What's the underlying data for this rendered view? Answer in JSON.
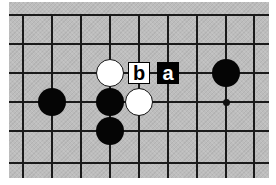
{
  "diagram": {
    "type": "go-board-fragment",
    "colors": {
      "board": "#bdbdbd",
      "grid": "#1a1a1a",
      "black_stone": "#050505",
      "white_stone": "#ffffff"
    },
    "grid": {
      "x_lines": [
        23,
        52,
        81,
        110,
        139,
        168,
        197,
        226,
        254
      ],
      "y_lines": [
        15,
        44,
        73,
        102,
        131,
        163
      ]
    },
    "stones": [
      {
        "color": "white",
        "col": 3,
        "row": 2
      },
      {
        "color": "black",
        "col": 7,
        "row": 2
      },
      {
        "color": "black",
        "col": 1,
        "row": 3
      },
      {
        "color": "black",
        "col": 3,
        "row": 3
      },
      {
        "color": "white",
        "col": 4,
        "row": 3
      },
      {
        "color": "black",
        "col": 3,
        "row": 4
      }
    ],
    "star_points": [
      {
        "col": 7,
        "row": 3
      }
    ],
    "labels": [
      {
        "text": "b",
        "col": 4,
        "row": 2,
        "style": "on-white"
      },
      {
        "text": "a",
        "col": 5,
        "row": 2,
        "style": "on-black"
      }
    ]
  }
}
